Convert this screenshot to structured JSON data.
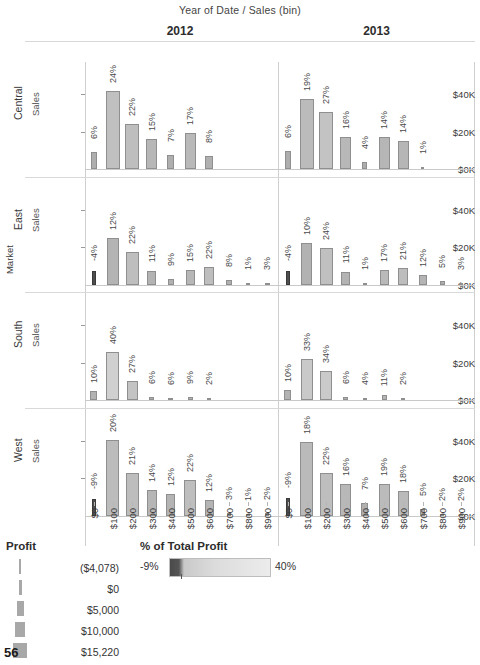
{
  "header": {
    "column_title": "Year of Date  /  Sales (bin)",
    "panels": [
      "2012",
      "2013"
    ]
  },
  "axes": {
    "row_axis_title": "Market",
    "y_axis_title": "Sales",
    "y_ticks": [
      "$40K",
      "$20K",
      "$0K"
    ],
    "x_ticks": [
      "$0",
      "$100",
      "$200",
      "$300",
      "$400",
      "$500",
      "$600",
      "$700",
      "$800",
      "$900"
    ]
  },
  "rows": [
    "Central",
    "East",
    "South",
    "West"
  ],
  "legend_size": {
    "title": "Profit",
    "items": [
      {
        "label": "($4,078)",
        "width": 2
      },
      {
        "label": "$0",
        "width": 3
      },
      {
        "label": "$5,000",
        "width": 7
      },
      {
        "label": "$10,000",
        "width": 10
      },
      {
        "label": "$15,220",
        "width": 14
      }
    ]
  },
  "legend_color": {
    "title": "% of Total Profit",
    "min_label": "-9%",
    "max_label": "40%",
    "min_color": "#4a4a4a",
    "max_color": "#ececec"
  },
  "page_number": "56",
  "chart_data": {
    "type": "bar",
    "title": "Year of Date  /  Sales (bin)",
    "xlabel": "Sales (bin)",
    "ylabel": "Sales",
    "ylim": [
      0,
      50000
    ],
    "y_ticks": [
      0,
      20000,
      40000
    ],
    "grid": false,
    "categories": [
      "$0",
      "$100",
      "$200",
      "$300",
      "$400",
      "$500",
      "$600",
      "$700",
      "$800",
      "$900"
    ],
    "row_facet": "Market",
    "column_facet": "Year of Date",
    "encoding": {
      "bar_height": "Sales",
      "bar_width": "Profit",
      "bar_color": "% of Total Profit",
      "bar_label": "% of Total Profit"
    },
    "panels": [
      {
        "market": "Central",
        "year": "2012",
        "bars": [
          {
            "bin": "$0",
            "sales": 9000,
            "pct_label": "6%",
            "pct": 6,
            "width": 6
          },
          {
            "bin": "$100",
            "sales": 41500,
            "pct_label": "24%",
            "pct": 24,
            "width": 14
          },
          {
            "bin": "$200",
            "sales": 24000,
            "pct_label": "22%",
            "pct": 22,
            "width": 14
          },
          {
            "bin": "$300",
            "sales": 16000,
            "pct_label": "15%",
            "pct": 15,
            "width": 11
          },
          {
            "bin": "$400",
            "sales": 7500,
            "pct_label": "7%",
            "pct": 7,
            "width": 7
          },
          {
            "bin": "$500",
            "sales": 19000,
            "pct_label": "17%",
            "pct": 17,
            "width": 11
          },
          {
            "bin": "$600",
            "sales": 7200,
            "pct_label": "8%",
            "pct": 8,
            "width": 8
          },
          {
            "bin": "$700",
            "sales": 0,
            "pct_label": "",
            "pct": 0,
            "width": 0
          },
          {
            "bin": "$800",
            "sales": 0,
            "pct_label": "",
            "pct": 0,
            "width": 0
          },
          {
            "bin": "$900",
            "sales": 0,
            "pct_label": "",
            "pct": 0,
            "width": 0
          }
        ]
      },
      {
        "market": "Central",
        "year": "2013",
        "bars": [
          {
            "bin": "$0",
            "sales": 9500,
            "pct_label": "6%",
            "pct": 6,
            "width": 6
          },
          {
            "bin": "$100",
            "sales": 37500,
            "pct_label": "19%",
            "pct": 19,
            "width": 14
          },
          {
            "bin": "$200",
            "sales": 30500,
            "pct_label": "27%",
            "pct": 27,
            "width": 14
          },
          {
            "bin": "$300",
            "sales": 17000,
            "pct_label": "16%",
            "pct": 16,
            "width": 11
          },
          {
            "bin": "$400",
            "sales": 4000,
            "pct_label": "4%",
            "pct": 4,
            "width": 5
          },
          {
            "bin": "$500",
            "sales": 17000,
            "pct_label": "14%",
            "pct": 14,
            "width": 11
          },
          {
            "bin": "$600",
            "sales": 15000,
            "pct_label": "14%",
            "pct": 14,
            "width": 11
          },
          {
            "bin": "$700",
            "sales": 900,
            "pct_label": "1%",
            "pct": 1,
            "width": 3
          },
          {
            "bin": "$800",
            "sales": 0,
            "pct_label": "",
            "pct": 0,
            "width": 0
          },
          {
            "bin": "$900",
            "sales": 0,
            "pct_label": "",
            "pct": 0,
            "width": 0
          }
        ]
      },
      {
        "market": "East",
        "year": "2012",
        "bars": [
          {
            "bin": "$0",
            "sales": 7000,
            "pct_label": "-4%",
            "pct": -4,
            "width": 4,
            "negative": true
          },
          {
            "bin": "$100",
            "sales": 25000,
            "pct_label": "12%",
            "pct": 12,
            "width": 12
          },
          {
            "bin": "$200",
            "sales": 17500,
            "pct_label": "22%",
            "pct": 22,
            "width": 13
          },
          {
            "bin": "$300",
            "sales": 7000,
            "pct_label": "11%",
            "pct": 11,
            "width": 9
          },
          {
            "bin": "$400",
            "sales": 3000,
            "pct_label": "9%",
            "pct": 9,
            "width": 6
          },
          {
            "bin": "$500",
            "sales": 7500,
            "pct_label": "15%",
            "pct": 15,
            "width": 9
          },
          {
            "bin": "$600",
            "sales": 9500,
            "pct_label": "22%",
            "pct": 22,
            "width": 10
          },
          {
            "bin": "$700",
            "sales": 2500,
            "pct_label": "8%",
            "pct": 8,
            "width": 6
          },
          {
            "bin": "$800",
            "sales": 800,
            "pct_label": "1%",
            "pct": 1,
            "width": 4
          },
          {
            "bin": "$900",
            "sales": 900,
            "pct_label": "3%",
            "pct": 3,
            "width": 5
          }
        ]
      },
      {
        "market": "East",
        "year": "2013",
        "bars": [
          {
            "bin": "$0",
            "sales": 7000,
            "pct_label": "-4%",
            "pct": -4,
            "width": 4,
            "negative": true
          },
          {
            "bin": "$100",
            "sales": 22000,
            "pct_label": "10%",
            "pct": 10,
            "width": 11
          },
          {
            "bin": "$200",
            "sales": 19500,
            "pct_label": "24%",
            "pct": 24,
            "width": 13
          },
          {
            "bin": "$300",
            "sales": 6500,
            "pct_label": "11%",
            "pct": 11,
            "width": 9
          },
          {
            "bin": "$400",
            "sales": 600,
            "pct_label": "1%",
            "pct": 1,
            "width": 4
          },
          {
            "bin": "$500",
            "sales": 8000,
            "pct_label": "17%",
            "pct": 17,
            "width": 9
          },
          {
            "bin": "$600",
            "sales": 9000,
            "pct_label": "21%",
            "pct": 21,
            "width": 10
          },
          {
            "bin": "$700",
            "sales": 5000,
            "pct_label": "12%",
            "pct": 12,
            "width": 8
          },
          {
            "bin": "$800",
            "sales": 1800,
            "pct_label": "5%",
            "pct": 5,
            "width": 5
          },
          {
            "bin": "$900",
            "sales": 700,
            "pct_label": "3%",
            "pct": 3,
            "width": 4
          }
        ]
      },
      {
        "market": "South",
        "year": "2012",
        "bars": [
          {
            "bin": "$0",
            "sales": 5000,
            "pct_label": "10%",
            "pct": 10,
            "width": 7
          },
          {
            "bin": "$100",
            "sales": 25500,
            "pct_label": "40%",
            "pct": 40,
            "width": 13
          },
          {
            "bin": "$200",
            "sales": 10000,
            "pct_label": "27%",
            "pct": 27,
            "width": 11
          },
          {
            "bin": "$300",
            "sales": 1400,
            "pct_label": "6%",
            "pct": 6,
            "width": 5
          },
          {
            "bin": "$400",
            "sales": 1200,
            "pct_label": "6%",
            "pct": 6,
            "width": 5
          },
          {
            "bin": "$500",
            "sales": 1800,
            "pct_label": "9%",
            "pct": 9,
            "width": 5
          },
          {
            "bin": "$600",
            "sales": 400,
            "pct_label": "2%",
            "pct": 2,
            "width": 4
          },
          {
            "bin": "$700",
            "sales": 0,
            "pct_label": "",
            "pct": 0,
            "width": 0
          },
          {
            "bin": "$800",
            "sales": 0,
            "pct_label": "",
            "pct": 0,
            "width": 0
          },
          {
            "bin": "$900",
            "sales": 0,
            "pct_label": "",
            "pct": 0,
            "width": 0
          }
        ]
      },
      {
        "market": "South",
        "year": "2013",
        "bars": [
          {
            "bin": "$0",
            "sales": 5500,
            "pct_label": "10%",
            "pct": 10,
            "width": 7
          },
          {
            "bin": "$100",
            "sales": 22000,
            "pct_label": "33%",
            "pct": 33,
            "width": 12
          },
          {
            "bin": "$200",
            "sales": 15500,
            "pct_label": "34%",
            "pct": 34,
            "width": 12
          },
          {
            "bin": "$300",
            "sales": 1600,
            "pct_label": "6%",
            "pct": 6,
            "width": 5
          },
          {
            "bin": "$400",
            "sales": 900,
            "pct_label": "4%",
            "pct": 4,
            "width": 4
          },
          {
            "bin": "$500",
            "sales": 2600,
            "pct_label": "11%",
            "pct": 11,
            "width": 5
          },
          {
            "bin": "$600",
            "sales": 300,
            "pct_label": "2%",
            "pct": 2,
            "width": 4
          },
          {
            "bin": "$700",
            "sales": 0,
            "pct_label": "",
            "pct": 0,
            "width": 0
          },
          {
            "bin": "$800",
            "sales": 0,
            "pct_label": "",
            "pct": 0,
            "width": 0
          },
          {
            "bin": "$900",
            "sales": 0,
            "pct_label": "",
            "pct": 0,
            "width": 0
          }
        ]
      },
      {
        "market": "West",
        "year": "2012",
        "bars": [
          {
            "bin": "$0",
            "sales": 9000,
            "pct_label": "-9%",
            "pct": -9,
            "width": 4,
            "negative": true
          },
          {
            "bin": "$100",
            "sales": 40500,
            "pct_label": "20%",
            "pct": 20,
            "width": 13
          },
          {
            "bin": "$200",
            "sales": 22500,
            "pct_label": "21%",
            "pct": 21,
            "width": 13
          },
          {
            "bin": "$300",
            "sales": 13500,
            "pct_label": "14%",
            "pct": 14,
            "width": 10
          },
          {
            "bin": "$400",
            "sales": 11500,
            "pct_label": "12%",
            "pct": 12,
            "width": 9
          },
          {
            "bin": "$500",
            "sales": 19000,
            "pct_label": "22%",
            "pct": 22,
            "width": 12
          },
          {
            "bin": "$600",
            "sales": 8500,
            "pct_label": "12%",
            "pct": 12,
            "width": 9
          },
          {
            "bin": "$700",
            "sales": 1300,
            "pct_label": "3%",
            "pct": 3,
            "width": 4
          },
          {
            "bin": "$800",
            "sales": 1000,
            "pct_label": "1%",
            "pct": 1,
            "width": 4
          },
          {
            "bin": "$900",
            "sales": 1100,
            "pct_label": "2%",
            "pct": 2,
            "width": 4
          }
        ]
      },
      {
        "market": "West",
        "year": "2013",
        "bars": [
          {
            "bin": "$0",
            "sales": 9500,
            "pct_label": "-9%",
            "pct": -9,
            "width": 4,
            "negative": true
          },
          {
            "bin": "$100",
            "sales": 39000,
            "pct_label": "18%",
            "pct": 18,
            "width": 13
          },
          {
            "bin": "$200",
            "sales": 22500,
            "pct_label": "22%",
            "pct": 22,
            "width": 13
          },
          {
            "bin": "$300",
            "sales": 17000,
            "pct_label": "16%",
            "pct": 16,
            "width": 11
          },
          {
            "bin": "$400",
            "sales": 6500,
            "pct_label": "7%",
            "pct": 7,
            "width": 7
          },
          {
            "bin": "$500",
            "sales": 17000,
            "pct_label": "19%",
            "pct": 19,
            "width": 11
          },
          {
            "bin": "$600",
            "sales": 13000,
            "pct_label": "18%",
            "pct": 18,
            "width": 11
          },
          {
            "bin": "$700",
            "sales": 3500,
            "pct_label": "5%",
            "pct": 5,
            "width": 5
          },
          {
            "bin": "$800",
            "sales": 700,
            "pct_label": "2%",
            "pct": 2,
            "width": 4
          },
          {
            "bin": "$900",
            "sales": 700,
            "pct_label": "2%",
            "pct": 2,
            "width": 4
          }
        ]
      }
    ]
  }
}
